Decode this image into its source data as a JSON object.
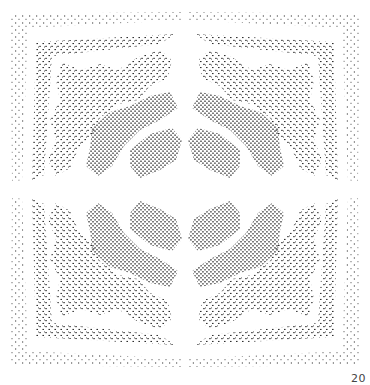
{
  "artwork": {
    "description": "Stippled ink drawing with four-fold symmetric holly-leaf pattern",
    "ink_color": "#1a1a1a",
    "background": "#ffffff"
  },
  "page_number": "20"
}
